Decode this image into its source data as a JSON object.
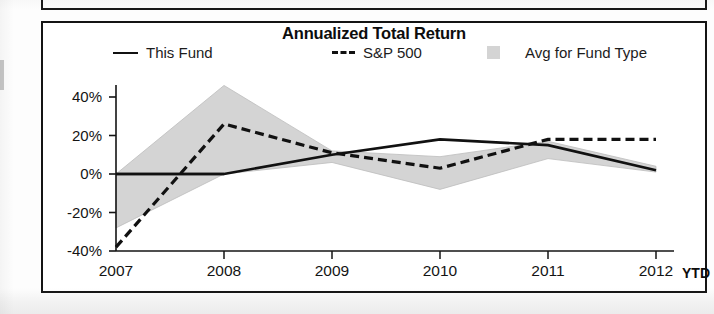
{
  "chart_data": {
    "type": "line",
    "title": "Annualized Total Return",
    "xlabel": "",
    "ylabel": "",
    "x": [
      "2007",
      "2008",
      "2009",
      "2010",
      "2011",
      "2012"
    ],
    "categories": [
      "2007",
      "2008",
      "2009",
      "2010",
      "2011",
      "2012"
    ],
    "xtick_labels": [
      "2007",
      "2008",
      "2009",
      "2010",
      "2011",
      "2012"
    ],
    "xaxis_suffix_label": "YTD",
    "ytick_labels": [
      "40%",
      "20%",
      "0%",
      "-20%",
      "-40%"
    ],
    "ytick_values": [
      40,
      20,
      0,
      -20,
      -40
    ],
    "ylim": [
      -44,
      52
    ],
    "grid": false,
    "legend_position": "top",
    "series": [
      {
        "name": "This Fund",
        "style": "solid",
        "color": "#111111",
        "marker": "line",
        "values": [
          0,
          0,
          10,
          18,
          15,
          2
        ]
      },
      {
        "name": "S&P 500",
        "style": "dashed",
        "color": "#111111",
        "marker": "dashed-line",
        "values": [
          -38,
          26,
          11,
          3,
          18,
          18
        ]
      },
      {
        "name": "Avg for Fund Type",
        "style": "band",
        "color": "#d4d4d4",
        "marker": "filled-square",
        "upper": [
          0,
          46,
          12,
          9,
          17,
          4
        ],
        "lower": [
          -28,
          0,
          6,
          -8,
          8,
          1
        ]
      }
    ],
    "legend": [
      {
        "label": "This Fund",
        "marker": "solid-line-swatch"
      },
      {
        "label": "S&P 500",
        "marker": "dashed-line-swatch"
      },
      {
        "label": "Avg for Fund Type",
        "marker": "gray-square-swatch"
      }
    ],
    "colors": {
      "axis": "#141414",
      "series_fund": "#111111",
      "series_index": "#111111",
      "band_fill": "#d4d4d4",
      "panel_border": "#141414",
      "background": "#ffffff"
    }
  }
}
